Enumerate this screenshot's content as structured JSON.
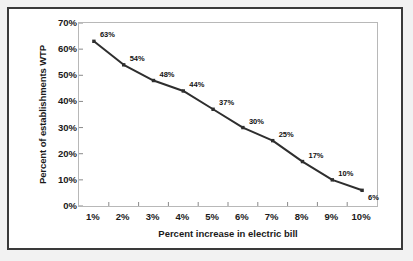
{
  "chart_data": {
    "type": "line",
    "title": "",
    "xlabel": "Percent increase in electric bill",
    "ylabel": "Percent of establishments WTP",
    "categories": [
      "1%",
      "2%",
      "3%",
      "4%",
      "5%",
      "6%",
      "7%",
      "8%",
      "9%",
      "10%"
    ],
    "values": [
      63,
      54,
      48,
      44,
      37,
      30,
      25,
      17,
      10,
      6
    ],
    "point_labels": [
      "63%",
      "54%",
      "48%",
      "44%",
      "37%",
      "30%",
      "25%",
      "17%",
      "10%",
      "6%"
    ],
    "ylim": [
      0,
      70
    ],
    "ytick_labels": [
      "0%",
      "10%",
      "20%",
      "30%",
      "40%",
      "50%",
      "60%",
      "70%"
    ],
    "ytick_values": [
      0,
      10,
      20,
      30,
      40,
      50,
      60,
      70
    ],
    "grid": false,
    "legend": "none",
    "series_color": "#2e2e2e",
    "marker": "square",
    "plot_border_color": "#b8b8b8",
    "frame_color": "#3a3a3a",
    "background_color": "#ffffff"
  }
}
